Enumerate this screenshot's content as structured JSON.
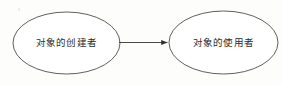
{
  "diagram": {
    "type": "relationship-diagram",
    "background_color": "#fdfdfc",
    "stroke_color": "#3a3a3a",
    "text_color": "#2b2b2b",
    "nodes": [
      {
        "id": "creator",
        "label": "对象的创建者",
        "shape": "ellipse",
        "cx": 66.5,
        "cy": 43,
        "rx": 53.5,
        "ry": 31
      },
      {
        "id": "user",
        "label": "对象的使用者",
        "shape": "ellipse",
        "cx": 223.5,
        "cy": 42.5,
        "rx": 54.5,
        "ry": 31.5
      }
    ],
    "edges": [
      {
        "id": "creator-to-user",
        "from": "creator",
        "to": "user",
        "style": "solid",
        "arrowhead": "filled-triangle",
        "x1": 119,
        "y1": 42.5,
        "x2": 168,
        "y2": 42.5
      }
    ]
  }
}
